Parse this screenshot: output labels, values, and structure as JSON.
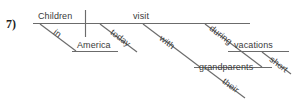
{
  "exercise": {
    "number": "7)"
  },
  "diagram": {
    "type": "reed-kellogg-sentence-diagram",
    "sentence": "Children in America today visit their grandparents during short vacations with",
    "line_color": "#6b6b6b",
    "text_color": "#3a3a3a",
    "words": {
      "subject": "Children",
      "verb": "visit",
      "direct_object": "grandparents",
      "preposition_1": "in",
      "prep_object_1": "America",
      "adverb_1": "today",
      "preposition_2": "with",
      "preposition_3": "during",
      "prep_object_3": "vacations",
      "adjective_1": "short",
      "possessive_1": "their"
    }
  }
}
